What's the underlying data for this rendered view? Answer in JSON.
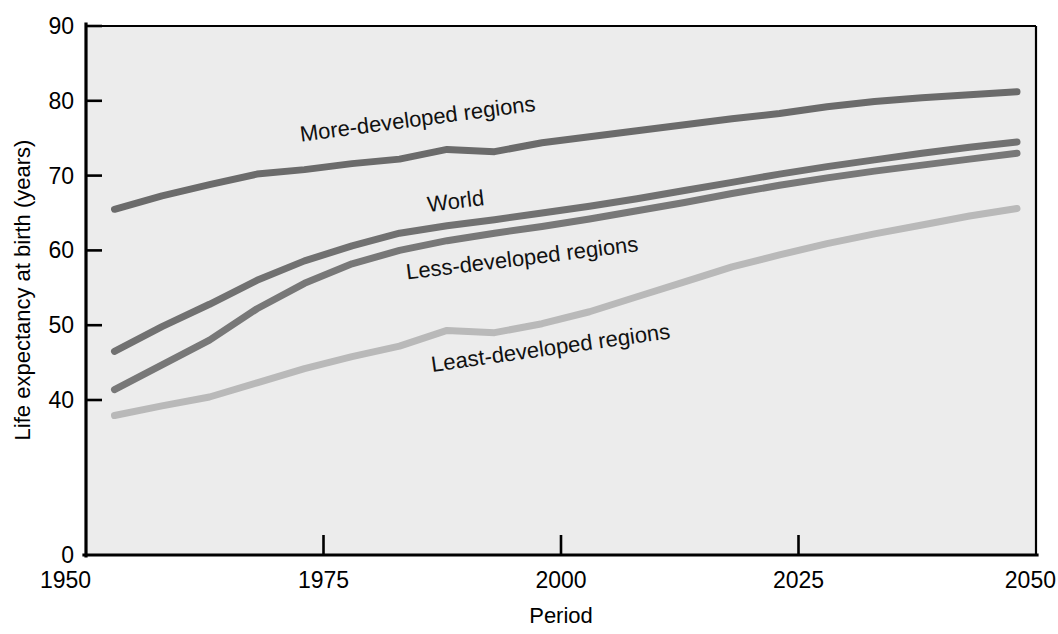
{
  "figure": {
    "background_color": "#ffffff",
    "plot_background_color": "#ececec"
  },
  "chart_data": {
    "type": "line",
    "title": "",
    "subtitle": "",
    "xlabel": "Period",
    "ylabel": "Life expectancy at birth (years)",
    "xlim": [
      1950,
      2050
    ],
    "ylim": [
      0,
      90
    ],
    "y_axis_note": "broken axis: 0 then 40 to 90 in steps of 10",
    "xticks": [
      1950,
      1975,
      2000,
      2025,
      2050
    ],
    "xtick_labels": [
      "1950",
      "1975",
      "2000",
      "2025",
      "2050"
    ],
    "yticks": [
      0,
      40,
      50,
      60,
      70,
      80,
      90
    ],
    "ytick_labels": [
      "0",
      "40",
      "50",
      "60",
      "70",
      "80",
      "90"
    ],
    "grid": false,
    "legend_position": "inline-annotations",
    "x": [
      1953,
      1958,
      1963,
      1968,
      1973,
      1978,
      1983,
      1988,
      1993,
      1998,
      2003,
      2008,
      2013,
      2018,
      2023,
      2028,
      2033,
      2038,
      2043,
      2048
    ],
    "series": [
      {
        "name": "More-developed regions",
        "color": "#6b6b6b",
        "label_x": 1985,
        "label_y": 76.6,
        "label_rotation": -7.5,
        "values": [
          65.5,
          67.3,
          68.8,
          70.2,
          70.8,
          71.6,
          72.2,
          73.5,
          73.2,
          74.4,
          75.2,
          76.0,
          76.8,
          77.6,
          78.3,
          79.2,
          79.9,
          80.4,
          80.8,
          81.2
        ]
      },
      {
        "name": "World",
        "color": "#717171",
        "label_x": 1989,
        "label_y": 65.6,
        "label_rotation": -7.0,
        "values": [
          46.5,
          49.8,
          52.8,
          56.0,
          58.6,
          60.6,
          62.3,
          63.3,
          64.1,
          65.0,
          65.9,
          66.9,
          68.0,
          69.1,
          70.2,
          71.2,
          72.1,
          73.0,
          73.8,
          74.5
        ]
      },
      {
        "name": "Less-developed regions",
        "color": "#787878",
        "label_x": 1996,
        "label_y": 58.0,
        "label_rotation": -7.0,
        "values": [
          41.4,
          44.7,
          48.0,
          52.2,
          55.6,
          58.2,
          60.0,
          61.3,
          62.3,
          63.2,
          64.2,
          65.3,
          66.4,
          67.6,
          68.7,
          69.7,
          70.6,
          71.4,
          72.2,
          73.0
        ]
      },
      {
        "name": "Least-developed regions",
        "color": "#b9b9b9",
        "label_x": 1999,
        "label_y": 46.0,
        "label_rotation": -8.0,
        "values": [
          36.0,
          38.5,
          40.4,
          42.3,
          44.2,
          45.8,
          47.2,
          49.3,
          49.0,
          50.2,
          51.8,
          53.8,
          55.8,
          57.8,
          59.4,
          60.9,
          62.2,
          63.4,
          64.6,
          65.6
        ]
      }
    ]
  },
  "axes": {
    "x_axis_label": "Period",
    "y_axis_label": "Life expectancy at birth (years)"
  }
}
